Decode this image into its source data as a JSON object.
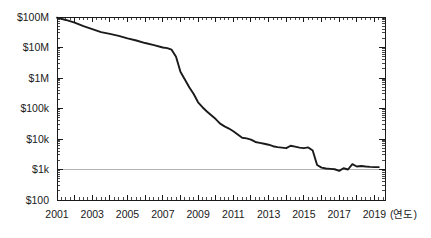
{
  "chart_data": {
    "type": "line",
    "title": "",
    "subtitle": "",
    "xlabel": "(연도)",
    "ylabel": "",
    "yscale": "log",
    "xlim": [
      2001,
      2019.6
    ],
    "ylim": [
      100,
      100000000
    ],
    "grid": false,
    "gridlines_shown": [
      "$1k"
    ],
    "legend": null,
    "legend_position": "none",
    "y_tick_labels": [
      "$100M",
      "$10M",
      "$1M",
      "$100k",
      "$10k",
      "$1k",
      "$100"
    ],
    "y_tick_values": [
      100000000,
      10000000,
      1000000,
      100000,
      10000,
      1000,
      100
    ],
    "x_tick_labels": [
      "2001",
      "2003",
      "2005",
      "2007",
      "2009",
      "2011",
      "2013",
      "2015",
      "2017",
      "2019"
    ],
    "x_tick_values": [
      2001,
      2003,
      2005,
      2007,
      2009,
      2011,
      2013,
      2015,
      2017,
      2019
    ],
    "x_minor_interval": 0.25,
    "series": [
      {
        "name": "cost",
        "color": "#1a1a1a",
        "x": [
          2001.0,
          2001.5,
          2002.0,
          2002.5,
          2003.0,
          2003.5,
          2004.0,
          2004.5,
          2005.0,
          2005.5,
          2006.0,
          2006.5,
          2007.0,
          2007.25,
          2007.5,
          2007.75,
          2008.0,
          2008.25,
          2008.5,
          2008.75,
          2009.0,
          2009.25,
          2009.5,
          2009.75,
          2010.0,
          2010.25,
          2010.5,
          2010.75,
          2011.0,
          2011.25,
          2011.5,
          2011.75,
          2012.0,
          2012.25,
          2012.5,
          2012.75,
          2013.0,
          2013.25,
          2013.5,
          2013.75,
          2014.0,
          2014.25,
          2014.5,
          2014.75,
          2015.0,
          2015.25,
          2015.5,
          2015.75,
          2016.0,
          2016.25,
          2016.5,
          2016.75,
          2017.0,
          2017.25,
          2017.5,
          2017.75,
          2018.0,
          2018.25,
          2018.5,
          2018.75,
          2019.0,
          2019.25
        ],
        "y": [
          95000000,
          80000000,
          65000000,
          50000000,
          40000000,
          32000000,
          28000000,
          24000000,
          20000000,
          17000000,
          14000000,
          12000000,
          10000000,
          9500000,
          8500000,
          5000000,
          1600000,
          900000,
          500000,
          300000,
          160000,
          110000,
          80000,
          60000,
          45000,
          32000,
          26000,
          22000,
          18000,
          14000,
          11000,
          10500,
          9500,
          8000,
          7500,
          7000,
          6500,
          5800,
          5400,
          5200,
          5000,
          6000,
          5600,
          5200,
          5000,
          5300,
          4200,
          1400,
          1150,
          1080,
          1050,
          1020,
          900,
          1100,
          1000,
          1500,
          1250,
          1300,
          1250,
          1220,
          1200,
          1200
        ]
      }
    ],
    "annotations": []
  },
  "plot_geometry": {
    "left": 57,
    "right": 385,
    "top": 17,
    "bottom": 200
  }
}
